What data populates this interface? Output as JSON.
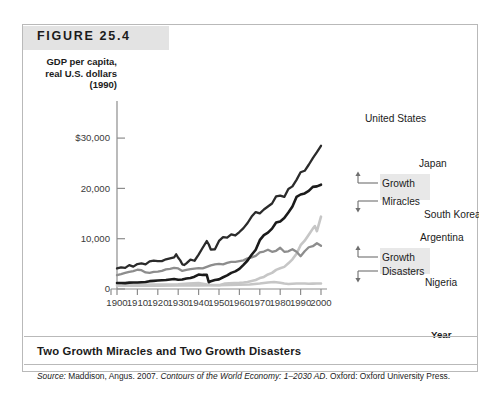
{
  "figure": {
    "number_label": "FIGURE 25.4",
    "caption": "Two Growth Miracles and Two Growth Disasters",
    "source_prefix": "Source:",
    "source_author": " Maddison, Angus. 2007. ",
    "source_title": "Contours of the World Economy: 1–2030 AD",
    "source_publisher": ". Oxford: Oxford University Press."
  },
  "axes": {
    "y_title_line1": "GDP per capita,",
    "y_title_line2": "real U.S. dollars",
    "y_title_line3": "(1990)",
    "x_title": "Year"
  },
  "annotations": {
    "growth_miracles_line1": "Growth",
    "growth_miracles_line2": "Miracles",
    "growth_disasters_line1": "Growth",
    "growth_disasters_line2": "Disasters"
  },
  "chart_data": {
    "type": "line",
    "title": "Two Growth Miracles and Two Growth Disasters",
    "xlabel": "Year",
    "ylabel": "GDP per capita, real U.S. dollars (1990)",
    "xlim": [
      1900,
      2000
    ],
    "ylim": [
      0,
      33000
    ],
    "grid": false,
    "legend_position": "right-inline-labels",
    "x_ticks": [
      1900,
      1910,
      1920,
      1930,
      1940,
      1950,
      1960,
      1970,
      1980,
      1990,
      2000
    ],
    "x_tick_labels": [
      "1900",
      "1910",
      "1920",
      "1930",
      "1940",
      "1950",
      "1960",
      "1970",
      "1980",
      "1990",
      "2000"
    ],
    "y_ticks": [
      0,
      10000,
      20000,
      30000
    ],
    "y_tick_labels": [
      "0",
      "10,000",
      "20,000",
      "$30,000"
    ],
    "series": [
      {
        "name": "United States",
        "group": "baseline",
        "color": "#2b2b2b",
        "width": 2.3,
        "x": [
          1900,
          1902,
          1904,
          1906,
          1908,
          1910,
          1912,
          1914,
          1916,
          1918,
          1920,
          1922,
          1924,
          1926,
          1928,
          1929,
          1930,
          1931,
          1932,
          1933,
          1934,
          1936,
          1938,
          1940,
          1942,
          1944,
          1945,
          1946,
          1948,
          1950,
          1952,
          1954,
          1956,
          1958,
          1960,
          1962,
          1964,
          1966,
          1968,
          1970,
          1972,
          1974,
          1976,
          1978,
          1980,
          1982,
          1984,
          1986,
          1988,
          1990,
          1992,
          1994,
          1996,
          1998,
          2000
        ],
        "y": [
          4091,
          4300,
          4200,
          4750,
          4450,
          4964,
          5100,
          4900,
          5500,
          5650,
          5552,
          5540,
          5900,
          6100,
          6300,
          6899,
          6213,
          5691,
          4908,
          4777,
          5114,
          5856,
          5618,
          6838,
          8206,
          9528,
          8852,
          7822,
          7900,
          9561,
          10316,
          10229,
          10870,
          10640,
          11328,
          12105,
          13120,
          14400,
          15300,
          15030,
          15800,
          16400,
          17000,
          18400,
          18577,
          18300,
          19900,
          20400,
          21700,
          23201,
          23500,
          24700,
          26000,
          27200,
          28467
        ]
      },
      {
        "name": "Argentina",
        "group": "disaster",
        "color": "#8d8d8d",
        "width": 2.3,
        "x": [
          1900,
          1902,
          1904,
          1906,
          1908,
          1910,
          1912,
          1914,
          1916,
          1918,
          1920,
          1922,
          1924,
          1926,
          1928,
          1930,
          1932,
          1934,
          1936,
          1938,
          1940,
          1942,
          1944,
          1946,
          1948,
          1950,
          1952,
          1954,
          1956,
          1958,
          1960,
          1962,
          1964,
          1966,
          1968,
          1970,
          1972,
          1974,
          1976,
          1978,
          1980,
          1982,
          1984,
          1986,
          1988,
          1990,
          1992,
          1994,
          1996,
          1998,
          2000
        ],
        "y": [
          2756,
          2950,
          3200,
          3400,
          3550,
          3822,
          3750,
          3300,
          3200,
          3400,
          3473,
          3600,
          3900,
          4000,
          4200,
          4080,
          3600,
          3800,
          3950,
          4072,
          4161,
          4100,
          4400,
          4700,
          4900,
          4987,
          4900,
          5200,
          5400,
          5400,
          5559,
          5700,
          6100,
          6300,
          6600,
          7302,
          7450,
          7800,
          7400,
          7600,
          8206,
          7400,
          7500,
          7900,
          7400,
          6512,
          7500,
          8300,
          8500,
          9100,
          8581
        ]
      },
      {
        "name": "Japan",
        "group": "miracle",
        "color": "#1b1b1b",
        "width": 2.6,
        "x": [
          1900,
          1902,
          1904,
          1906,
          1908,
          1910,
          1912,
          1914,
          1916,
          1918,
          1920,
          1922,
          1924,
          1926,
          1928,
          1930,
          1932,
          1934,
          1936,
          1938,
          1940,
          1942,
          1944,
          1945,
          1946,
          1948,
          1950,
          1952,
          1954,
          1956,
          1958,
          1960,
          1962,
          1964,
          1966,
          1968,
          1970,
          1972,
          1974,
          1976,
          1978,
          1980,
          1982,
          1984,
          1986,
          1988,
          1990,
          1992,
          1994,
          1996,
          1998,
          2000
        ],
        "y": [
          1180,
          1200,
          1170,
          1270,
          1280,
          1304,
          1350,
          1380,
          1560,
          1620,
          1696,
          1750,
          1780,
          1900,
          2000,
          1850,
          1900,
          2100,
          2200,
          2449,
          2874,
          2800,
          2800,
          1346,
          1550,
          1800,
          1921,
          2336,
          2700,
          3200,
          3500,
          3986,
          4800,
          5668,
          6800,
          7800,
          9714,
          10700,
          11200,
          12000,
          13200,
          13428,
          14100,
          15200,
          16400,
          18300,
          18789,
          19000,
          19500,
          20300,
          20400,
          20738
        ]
      },
      {
        "name": "South Korea",
        "group": "miracle",
        "color": "#c6c6c6",
        "width": 2.6,
        "x": [
          1900,
          1910,
          1920,
          1930,
          1935,
          1940,
          1945,
          1950,
          1953,
          1955,
          1960,
          1962,
          1964,
          1966,
          1968,
          1970,
          1972,
          1974,
          1976,
          1978,
          1980,
          1982,
          1984,
          1986,
          1988,
          1990,
          1992,
          1994,
          1996,
          1997,
          1998,
          2000
        ],
        "y": [
          850,
          860,
          900,
          950,
          1100,
          1200,
          850,
          770,
          1100,
          1150,
          1226,
          1300,
          1400,
          1600,
          1800,
          2167,
          2400,
          2900,
          3200,
          3800,
          4114,
          4400,
          5100,
          5900,
          7000,
          8704,
          9600,
          10800,
          12000,
          12500,
          11500,
          14375
        ]
      },
      {
        "name": "Nigeria",
        "group": "disaster",
        "color": "#c6c6c6",
        "width": 2.6,
        "x": [
          1900,
          1910,
          1920,
          1930,
          1940,
          1950,
          1955,
          1960,
          1965,
          1970,
          1974,
          1977,
          1980,
          1982,
          1984,
          1986,
          1988,
          1990,
          1992,
          1994,
          1996,
          1998,
          2000
        ],
        "y": [
          650,
          660,
          680,
          700,
          720,
          753,
          800,
          854,
          900,
          1100,
          1300,
          1400,
          1250,
          1100,
          1000,
          1050,
          1080,
          1100,
          1090,
          1050,
          1060,
          1080,
          1100
        ]
      }
    ],
    "series_labels": [
      {
        "name": "United States",
        "x_px": 342,
        "y_px": 121
      },
      {
        "name": "Japan",
        "x_px": 396,
        "y_px": 166
      },
      {
        "name": "South Korea",
        "x_px": 401,
        "y_px": 217
      },
      {
        "name": "Argentina",
        "x_px": 397,
        "y_px": 240
      },
      {
        "name": "Nigeria",
        "x_px": 402,
        "y_px": 285
      }
    ]
  }
}
